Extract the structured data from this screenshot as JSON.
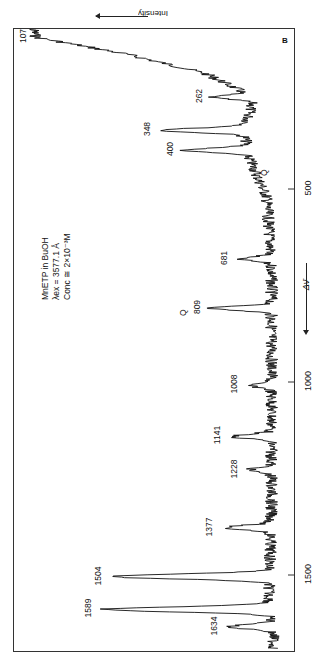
{
  "chart_data": {
    "type": "line",
    "title": "MnETP in BuOH",
    "subtitle_lines": [
      "MnETP  in  BuOH",
      "λex = 3577.1 Å",
      "Conc ≅ 2×10⁻³M"
    ],
    "panel_label": "B",
    "orientation": "rotated -90° (wavenumber along vertical, intensity increases to the left)",
    "xlabel": "Δν̄",
    "ylabel": "Intensity",
    "xlim": [
      0,
      1700
    ],
    "x_ticks": [
      500,
      1000,
      1500
    ],
    "x_tick_labels": [
      "500",
      "1000",
      "1500"
    ],
    "intensity_units": "relative (0 = baseline, 100 = strongest)",
    "grid": false,
    "legend": null,
    "peaks": [
      {
        "wavenumber": 107,
        "label": "107",
        "intensity": 98
      },
      {
        "wavenumber": 262,
        "label": "262",
        "intensity": 27
      },
      {
        "wavenumber": 348,
        "label": "348",
        "intensity": 47
      },
      {
        "wavenumber": 400,
        "label": "400",
        "intensity": 38
      },
      {
        "wavenumber": 681,
        "label": "681",
        "intensity": 16
      },
      {
        "wavenumber": 809,
        "label": "809",
        "intensity": 27,
        "annotation": "Q"
      },
      {
        "wavenumber": 1008,
        "label": "1008",
        "intensity": 12
      },
      {
        "wavenumber": 1141,
        "label": "1141",
        "intensity": 19
      },
      {
        "wavenumber": 1228,
        "label": "1228",
        "intensity": 12
      },
      {
        "wavenumber": 1377,
        "label": "1377",
        "intensity": 22
      },
      {
        "wavenumber": 1504,
        "label": "1504",
        "intensity": 67
      },
      {
        "wavenumber": 1589,
        "label": "1589",
        "intensity": 71
      },
      {
        "wavenumber": 1634,
        "label": "1634",
        "intensity": 20
      }
    ],
    "annotations": [
      {
        "text": "Q",
        "wavenumber": 809,
        "note": "above 809 label"
      },
      {
        "text": "Q",
        "wavenumber": 445,
        "note": "near baseline below 400 peak"
      }
    ],
    "baseline_profile": [
      {
        "wavenumber": 70,
        "intensity": 100
      },
      {
        "wavenumber": 107,
        "intensity": 98
      },
      {
        "wavenumber": 150,
        "intensity": 62
      },
      {
        "wavenumber": 200,
        "intensity": 30
      },
      {
        "wavenumber": 262,
        "intensity": 10
      },
      {
        "wavenumber": 348,
        "intensity": 14
      },
      {
        "wavenumber": 420,
        "intensity": 12
      },
      {
        "wavenumber": 520,
        "intensity": 5
      },
      {
        "wavenumber": 700,
        "intensity": 3
      },
      {
        "wavenumber": 1000,
        "intensity": 3
      },
      {
        "wavenumber": 1300,
        "intensity": 3
      },
      {
        "wavenumber": 1550,
        "intensity": 4
      },
      {
        "wavenumber": 1680,
        "intensity": 2
      }
    ]
  },
  "labels": {
    "intensity": "Intensity",
    "delta_nu": "Δν̄",
    "panel": "B",
    "info_line1": "MnETP  in  BuOH",
    "info_line2": "λex = 3577.1 Å",
    "info_line3": "Conc ≅ 2×10⁻³M",
    "tick_500": "500",
    "tick_1000": "1000",
    "tick_1500": "1500",
    "q1": "Q",
    "q2": "Q"
  }
}
